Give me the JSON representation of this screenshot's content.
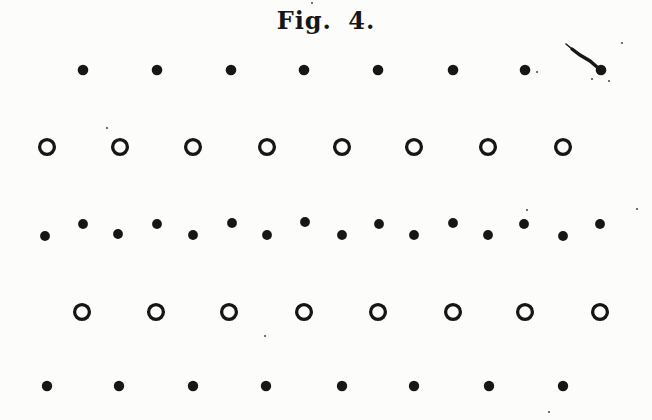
{
  "figure": {
    "title": "Fig. 4.",
    "background_color": "#fcfcfa",
    "ink_color": "#161616"
  },
  "lattice": {
    "rows": [
      {
        "glyph_name": "filled-dot",
        "kind": "dot",
        "radius": 5.3,
        "y": 70,
        "x_values": [
          83,
          157,
          231,
          304,
          378,
          453,
          525,
          601
        ]
      },
      {
        "glyph_name": "open-circle",
        "kind": "ring",
        "radius": 7.4,
        "stroke_width": 3.3,
        "y": 147,
        "x_values": [
          47,
          120,
          193,
          267,
          342,
          414,
          488,
          563
        ]
      },
      {
        "glyph_name": "filled-dot",
        "kind": "dot",
        "radius": 4.9,
        "points": [
          [
            45,
            236
          ],
          [
            83,
            224
          ],
          [
            118,
            234
          ],
          [
            157,
            224
          ],
          [
            193,
            235
          ],
          [
            232,
            223
          ],
          [
            267,
            235
          ],
          [
            305,
            222
          ],
          [
            342,
            235
          ],
          [
            379,
            224
          ],
          [
            414,
            235
          ],
          [
            453,
            223
          ],
          [
            488,
            235
          ],
          [
            524,
            224
          ],
          [
            563,
            236
          ],
          [
            600,
            224
          ]
        ]
      },
      {
        "glyph_name": "open-circle",
        "kind": "ring",
        "radius": 7.4,
        "stroke_width": 3.3,
        "y": 312,
        "x_values": [
          82,
          156,
          229,
          304,
          378,
          453,
          525,
          600
        ]
      },
      {
        "glyph_name": "filled-dot",
        "kind": "dot",
        "radius": 5.2,
        "y": 386,
        "x_values": [
          47,
          119,
          193,
          266,
          342,
          414,
          489,
          563
        ]
      }
    ]
  },
  "artifacts": {
    "smudge_stroke": {
      "points": [
        [
          572,
          49
        ],
        [
          580,
          55
        ],
        [
          590,
          61
        ],
        [
          597,
          67
        ]
      ],
      "barb": [
        [
          572,
          49
        ],
        [
          566,
          44
        ]
      ],
      "width": 3.4
    },
    "specks": [
      [
        312,
        3
      ],
      [
        537,
        72
      ],
      [
        622,
        43
      ],
      [
        592,
        79
      ],
      [
        609,
        81
      ],
      [
        107,
        128
      ],
      [
        265,
        336
      ],
      [
        527,
        210
      ],
      [
        637,
        209
      ],
      [
        549,
        412
      ]
    ]
  }
}
